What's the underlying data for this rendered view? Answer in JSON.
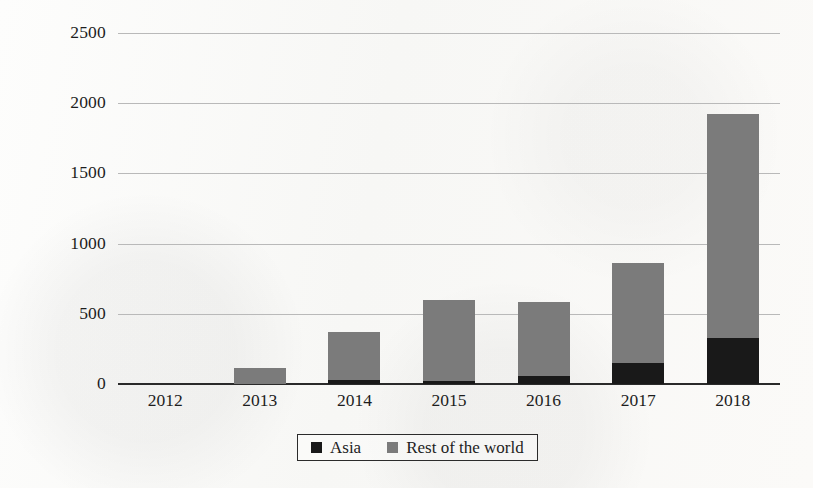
{
  "chart_data": {
    "type": "bar",
    "subtype": "stacked-vertical",
    "title": "",
    "xlabel": "",
    "ylabel": "",
    "categories": [
      "2012",
      "2013",
      "2014",
      "2015",
      "2016",
      "2017",
      "2018"
    ],
    "series": [
      {
        "name": "Asia",
        "color": "#191919",
        "values": [
          0,
          0,
          30,
          25,
          60,
          150,
          325
        ]
      },
      {
        "name": "Rest of the world",
        "color": "#7b7b7b",
        "values": [
          0,
          115,
          340,
          570,
          525,
          710,
          1595
        ]
      }
    ],
    "totals": [
      0,
      115,
      370,
      595,
      585,
      860,
      1920
    ],
    "ylim": [
      0,
      2500
    ],
    "ytick_values": [
      0,
      500,
      1000,
      1500,
      2000,
      2500
    ],
    "ytick_labels": [
      "0",
      "500",
      "1000",
      "1500",
      "2000",
      "2500"
    ],
    "grid": true,
    "grid_axis": "y",
    "legend_position": "bottom-center",
    "legend": [
      "Asia",
      "Rest of the world"
    ],
    "background_color": "#fbfbfa",
    "axis_color": "#2a2a2a",
    "grid_color": "#b9b9b9"
  }
}
